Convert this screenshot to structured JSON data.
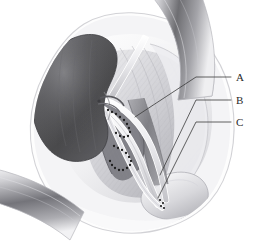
{
  "figure": {
    "kind": "medical-illustration",
    "modality": "grayscale line-and-tone surgical drawing",
    "background_color": "#ffffff",
    "ink_color": "#2a2a2a",
    "width_px": 259,
    "height_px": 252
  },
  "labels": [
    {
      "id": "A",
      "text": "A",
      "x": 236,
      "y": 72
    },
    {
      "id": "B",
      "text": "B",
      "x": 236,
      "y": 95
    },
    {
      "id": "C",
      "text": "C",
      "x": 236,
      "y": 117
    }
  ],
  "leaders": [
    {
      "for": "A",
      "from_x": 135,
      "from_y": 117,
      "elbow_x": 196,
      "elbow_y": 77,
      "to_x": 231,
      "to_y": 77
    },
    {
      "for": "B",
      "from_x": 160,
      "from_y": 175,
      "elbow_x": 196,
      "elbow_y": 100,
      "to_x": 231,
      "to_y": 100
    },
    {
      "for": "C",
      "from_x": 158,
      "from_y": 198,
      "elbow_x": 196,
      "elbow_y": 122,
      "to_x": 231,
      "to_y": 122
    }
  ],
  "structures": {
    "kidney": "kidney-graft",
    "renal_vessels": "renal-artery-and-vein",
    "ureter": "ureter",
    "bladder": "urinary-bladder",
    "iliac_vessels": "iliac-artery-and-vein",
    "retractor_bands": "wound-retractor-bands",
    "body_wall": "abdominal-wall-incision"
  },
  "palette": {
    "kidney_dark": "#4a4a4c",
    "kidney_mid": "#6e6e70",
    "kidney_light": "#8d8d90",
    "vessel_light": "#e8e8ea",
    "vessel_mid": "#b9b9bd",
    "vessel_dark": "#8a8a8e",
    "tissue_pale": "#f2f2f3",
    "tissue_shade": "#d7d7da",
    "band_dark": "#6a6a6e",
    "band_light": "#ededf0",
    "suture": "#1e1e1e",
    "outline": "#9a9a9e"
  }
}
